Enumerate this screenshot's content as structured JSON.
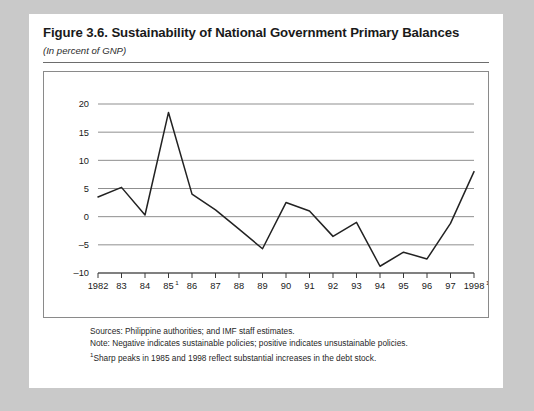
{
  "figure": {
    "title": "Figure 3.6.  Sustainability of National Government Primary Balances",
    "subtitle": "(In percent of GNP)"
  },
  "notes": {
    "sources": "Sources:  Philippine authorities; and IMF staff estimates.",
    "note": "Note:  Negative indicates sustainable policies; positive indicates unsustainable policies.",
    "footnote_marker": "1",
    "footnote": "Sharp peaks in 1985 and 1998 reflect substantial increases in the debt stock."
  },
  "colors": {
    "page_background": "#c9c9c9",
    "panel": "#ffffff",
    "line": "#222222",
    "gridline": "#8f8f8f",
    "axis": "#3a3a3a",
    "text": "#1a1a1a"
  },
  "chart_data": {
    "type": "line",
    "title": "Figure 3.6.  Sustainability of National Government Primary Balances",
    "subtitle": "(In percent of GNP)",
    "xlabel": "",
    "ylabel": "",
    "ylim": [
      -10,
      20
    ],
    "yticks": [
      -10,
      -5,
      0,
      5,
      10,
      15,
      20
    ],
    "ytick_labels": [
      "–10",
      "–5",
      "0",
      "5",
      "10",
      "15",
      "20"
    ],
    "grid": true,
    "legend": false,
    "x": [
      1982,
      1983,
      1984,
      1985,
      1986,
      1987,
      1988,
      1989,
      1990,
      1991,
      1992,
      1993,
      1994,
      1995,
      1996,
      1997,
      1998
    ],
    "xtick_labels": [
      "1982",
      "83",
      "84",
      "85",
      "86",
      "87",
      "88",
      "89",
      "90",
      "91",
      "92",
      "93",
      "94",
      "95",
      "96",
      "97",
      "1998"
    ],
    "xtick_superscripts": {
      "85": "1",
      "1998": "1"
    },
    "series": [
      {
        "name": "Primary balance",
        "values": [
          3.5,
          5.2,
          0.3,
          18.5,
          4.0,
          1.2,
          -2.2,
          -5.7,
          2.5,
          1.0,
          -3.5,
          -1.0,
          -8.8,
          -6.3,
          -7.5,
          -1.2,
          8.0
        ]
      }
    ]
  }
}
